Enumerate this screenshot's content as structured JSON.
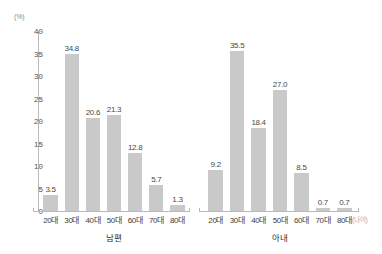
{
  "chart_data": {
    "type": "bar",
    "title": "",
    "xlabel": "(나이)",
    "ylabel": "(%)",
    "ylim": [
      0,
      40
    ],
    "ytick_step": 5,
    "grid": false,
    "legend": "none",
    "bar_color": "#c9c9c9",
    "axis_color": "#b9b9b9",
    "categories": [
      "20대",
      "30대",
      "40대",
      "50대",
      "60대",
      "70대",
      "80대"
    ],
    "ytick_labels": [
      "0",
      "5",
      "10",
      "15",
      "20",
      "25",
      "30",
      "35",
      "40"
    ],
    "series": [
      {
        "name": "남편",
        "values": [
          3.5,
          34.8,
          20.6,
          21.3,
          12.8,
          5.7,
          1.3
        ],
        "labels": [
          "3.5",
          "34.8",
          "20.6",
          "21.3",
          "12.8",
          "5.7",
          "1.3"
        ]
      },
      {
        "name": "아내",
        "values": [
          9.2,
          35.5,
          18.4,
          27.0,
          8.5,
          0.7,
          0.7
        ],
        "labels": [
          "9.2",
          "35.5",
          "18.4",
          "27.0",
          "8.5",
          "0.7",
          "0.7"
        ]
      }
    ]
  }
}
